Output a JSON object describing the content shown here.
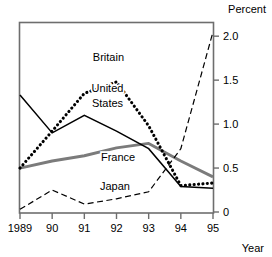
{
  "chart_data": {
    "type": "line",
    "title": "",
    "xlabel": "Year",
    "ylabel": "Percent",
    "x": [
      1989,
      1990,
      1991,
      1992,
      1993,
      1994,
      1995
    ],
    "xtick_labels": [
      "1989",
      "90",
      "91",
      "92",
      "93",
      "94",
      "95"
    ],
    "ytick_labels": [
      "0",
      "0.5",
      "1.0",
      "1.5",
      "2.0"
    ],
    "yticks": [
      0,
      0.5,
      1.0,
      1.5,
      2.0
    ],
    "ylim": [
      0,
      2.15
    ],
    "xlim": [
      1989,
      1995
    ],
    "grid": false,
    "legend_position": "inline-annotations",
    "series": [
      {
        "name": "Britain",
        "style": "dotted-thick",
        "color": "#000000",
        "values": [
          0.5,
          0.92,
          1.35,
          1.48,
          0.98,
          0.3,
          0.33
        ]
      },
      {
        "name": "United States",
        "style": "solid-thin",
        "color": "#000000",
        "values": [
          1.33,
          0.9,
          1.1,
          0.92,
          0.72,
          0.29,
          0.27
        ]
      },
      {
        "name": "France",
        "style": "solid-thick-gray",
        "color": "#7b7b7b",
        "values": [
          0.5,
          0.58,
          0.64,
          0.73,
          0.78,
          0.58,
          0.4
        ]
      },
      {
        "name": "Japan",
        "style": "dashed",
        "color": "#000000",
        "values": [
          0.03,
          0.25,
          0.09,
          0.15,
          0.23,
          0.72,
          2.05
        ]
      }
    ],
    "annotations": [
      {
        "text": "Britain",
        "x": 1991.75,
        "y": 1.72
      },
      {
        "text": "United",
        "x": 1991.72,
        "y": 1.36
      },
      {
        "text": "States",
        "x": 1991.72,
        "y": 1.2
      },
      {
        "text": "France",
        "x": 1992.05,
        "y": 0.58
      },
      {
        "text": "Japan",
        "x": 1991.95,
        "y": 0.25
      }
    ]
  },
  "axes": {
    "percent_label": "Percent",
    "year_label": "Year"
  }
}
